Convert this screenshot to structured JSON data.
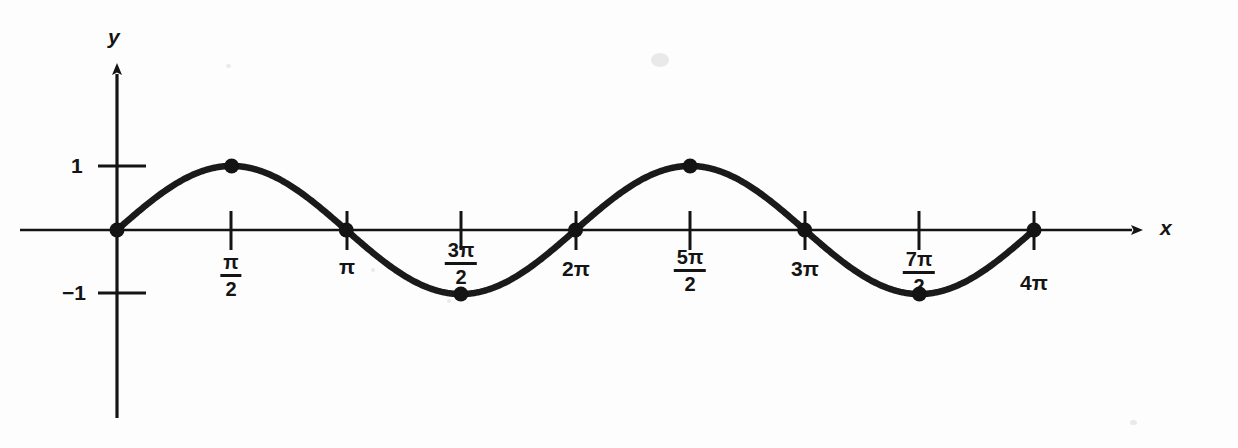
{
  "figure": {
    "background_color": "#fdfdfd",
    "ink_color": "#141414",
    "axis_labels": {
      "x": "x",
      "y": "y"
    }
  },
  "axes": {
    "x_ticks": [
      {
        "label_kind": "plain",
        "label": "0",
        "value": 0,
        "shown": false
      },
      {
        "label_kind": "fraction",
        "numerator": "π",
        "denominator": "2",
        "value": 1.5708
      },
      {
        "label_kind": "plain",
        "label": "π",
        "value": 3.1416
      },
      {
        "label_kind": "fraction",
        "numerator": "3π",
        "denominator": "2",
        "value": 4.7124
      },
      {
        "label_kind": "plain",
        "label": "2π",
        "value": 6.2832
      },
      {
        "label_kind": "fraction",
        "numerator": "5π",
        "denominator": "2",
        "value": 7.854
      },
      {
        "label_kind": "plain",
        "label": "3π",
        "value": 9.4248
      },
      {
        "label_kind": "fraction",
        "numerator": "7π",
        "denominator": "2",
        "value": 10.9956
      },
      {
        "label_kind": "plain",
        "label": "4π",
        "value": 12.5664
      }
    ],
    "y_ticks": [
      {
        "label": "1",
        "value": 1
      },
      {
        "label": "−1",
        "value": -1
      }
    ]
  },
  "chart_data": {
    "type": "line",
    "title": "",
    "subtitle": "",
    "xlabel": "x",
    "ylabel": "y",
    "xlim": [
      0,
      12.5664
    ],
    "ylim": [
      -1,
      1
    ],
    "grid": false,
    "legend": null,
    "xtick_labels": [
      "π/2",
      "π",
      "3π/2",
      "2π",
      "5π/2",
      "3π",
      "7π/2",
      "4π"
    ],
    "xtick_values": [
      1.5708,
      3.1416,
      4.7124,
      6.2832,
      7.854,
      9.4248,
      10.9956,
      12.5664
    ],
    "ytick_labels": [
      "1",
      "−1"
    ],
    "ytick_values": [
      1,
      -1
    ],
    "series": [
      {
        "name": "y = sin x",
        "equation": "y = sin(x)",
        "amplitude": 1,
        "period": 6.2832,
        "x_start": 0,
        "x_end": 12.5664,
        "marked_points": [
          {
            "x": 0,
            "y": 0,
            "label": "0"
          },
          {
            "x": 1.5708,
            "y": 1,
            "label": "π/2"
          },
          {
            "x": 3.1416,
            "y": 0,
            "label": "π"
          },
          {
            "x": 4.7124,
            "y": -1,
            "label": "3π/2"
          },
          {
            "x": 6.2832,
            "y": 0,
            "label": "2π"
          },
          {
            "x": 7.854,
            "y": 1,
            "label": "5π/2"
          },
          {
            "x": 9.4248,
            "y": 0,
            "label": "3π"
          },
          {
            "x": 10.9956,
            "y": -1,
            "label": "7π/2"
          },
          {
            "x": 12.5664,
            "y": 0,
            "label": "4π"
          }
        ]
      }
    ]
  }
}
